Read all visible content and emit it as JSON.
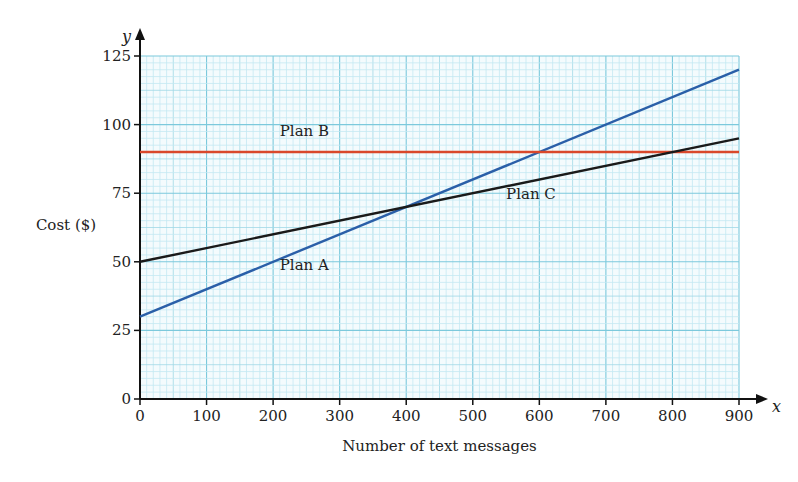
{
  "chart_data": {
    "type": "line",
    "title": "",
    "xlabel": "Number of text messages",
    "ylabel": "Cost ($)",
    "x_axis_symbol": "x",
    "y_axis_symbol": "y",
    "xlim": [
      0,
      900
    ],
    "ylim": [
      0,
      125
    ],
    "xticks": [
      0,
      100,
      200,
      300,
      400,
      500,
      600,
      700,
      800,
      900
    ],
    "yticks": [
      0,
      25,
      50,
      75,
      100,
      125
    ],
    "grid": true,
    "series": [
      {
        "name": "Plan A",
        "color": "#2a5fa8",
        "x": [
          0,
          900
        ],
        "y": [
          30,
          120
        ],
        "label_pos": [
          210,
          47
        ]
      },
      {
        "name": "Plan B",
        "color": "#d9482b",
        "x": [
          0,
          900
        ],
        "y": [
          90,
          90
        ],
        "label_pos": [
          210,
          96
        ]
      },
      {
        "name": "Plan C",
        "color": "#1a1a1a",
        "x": [
          0,
          900
        ],
        "y": [
          50,
          95
        ],
        "label_pos": [
          550,
          73
        ]
      }
    ]
  }
}
